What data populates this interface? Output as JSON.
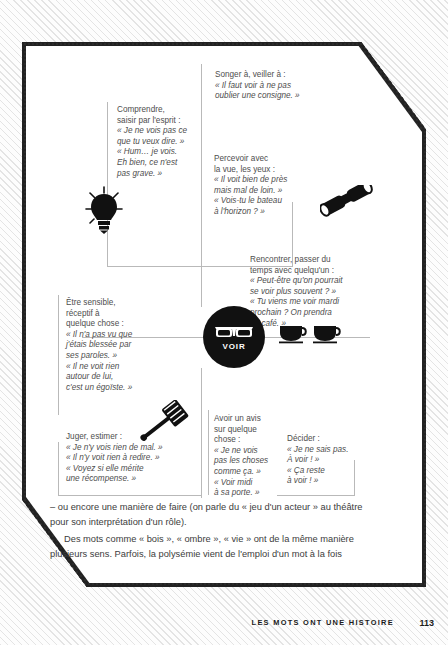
{
  "page": {
    "footer_title": "LES MOTS ONT UNE HISTOIRE",
    "page_number": "113"
  },
  "diagram": {
    "center": {
      "label": "VOIR",
      "icon": "sunglasses-icon"
    },
    "nodes": [
      {
        "id": "songer",
        "head": "Songer à, veiller à :",
        "quotes": [
          "« Il faut voir à ne pas",
          "oublier une consigne. »"
        ],
        "icon": null
      },
      {
        "id": "comprendre",
        "head_lines": [
          "Comprendre,",
          "saisir par l'esprit :"
        ],
        "quotes": [
          "« Je ne vois pas ce",
          "que tu veux dire. »",
          "« Hum… je vois.",
          "Eh bien, ce n'est",
          "pas grave. »"
        ],
        "icon": "lightbulb-icon"
      },
      {
        "id": "percevoir",
        "head_lines": [
          "Percevoir avec",
          "la vue, les yeux :"
        ],
        "quotes": [
          "« Il voit bien de près",
          "mais mal de loin. »",
          "« Vois-tu le bateau",
          "à l'horizon ? »"
        ],
        "icon": "binoculars-icon"
      },
      {
        "id": "rencontrer",
        "head_lines": [
          "Rencontrer, passer du",
          "temps avec quelqu'un :"
        ],
        "quotes": [
          "« Peut-être qu'on pourrait",
          "se voir plus souvent ? »",
          "« Tu viens me voir mardi",
          "prochain ? On prendra",
          "un café. »"
        ],
        "icon": "coffee-cups-icon"
      },
      {
        "id": "etre-sensible",
        "head_lines": [
          "Être sensible,",
          "réceptif à",
          "quelque chose :"
        ],
        "quotes": [
          "« Il n'a pas vu que",
          "j'étais blessée par",
          "ses paroles. »",
          "« Il ne voit rien",
          "autour de lui,",
          "c'est un égoïste. »"
        ],
        "icon": null
      },
      {
        "id": "juger",
        "head_lines": [
          "Juger, estimer :"
        ],
        "quotes": [
          "« Je n'y vois rien de mal. »",
          "« Il n'y voit rien à redire. »",
          "« Voyez si elle mérite",
          "une récompense. »"
        ],
        "icon": "gavel-icon"
      },
      {
        "id": "avis",
        "head_lines": [
          "Avoir un avis",
          "sur quelque",
          "chose :"
        ],
        "quotes": [
          "« Je ne vois",
          "pas les choses",
          "comme ça. »",
          "« Voir midi",
          "à sa porte. »"
        ],
        "icon": null
      },
      {
        "id": "decider",
        "head_lines": [
          "Décider :"
        ],
        "quotes": [
          "« Je ne sais pas.",
          "À voir ! »",
          "« Ça reste",
          "à voir ! »"
        ],
        "icon": null
      }
    ]
  },
  "body": {
    "paragraph1": "– ou encore une manière de faire (on parle du « jeu d'un acteur » au théâtre pour son interprétation d'un rôle).",
    "paragraph2": "Des mots comme « bois », « ombre », « vie » ont de la même manière plusieurs sens. Parfois, la polysémie vient de l'emploi d'un mot à la fois"
  }
}
